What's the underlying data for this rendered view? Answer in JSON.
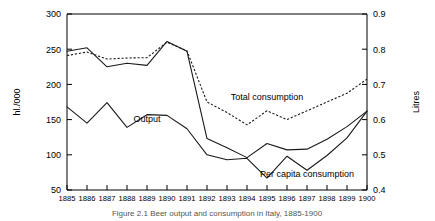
{
  "chart_data": {
    "type": "line",
    "title": "",
    "xlabel": "",
    "ylabel": "hl./000",
    "y2label": "Litres",
    "grid": false,
    "legend_position": "inline-annotations",
    "x": [
      1885,
      1886,
      1887,
      1888,
      1889,
      1890,
      1891,
      1892,
      1893,
      1894,
      1895,
      1896,
      1897,
      1898,
      1899,
      1900
    ],
    "xtick_labels": [
      "1885",
      "1886",
      "1887",
      "1888",
      "1889",
      "1890",
      "1891",
      "1892",
      "1893",
      "1894",
      "1895",
      "1896",
      "1897",
      "1898",
      "1899",
      "1900"
    ],
    "ylim": [
      50,
      300
    ],
    "ytick_labels": [
      "300",
      "250",
      "200",
      "150",
      "100",
      "50"
    ],
    "ytick_values": [
      300,
      250,
      200,
      150,
      100,
      50
    ],
    "y2lim": [
      0.4,
      0.9
    ],
    "y2tick_labels": [
      "0.9",
      "0.8",
      "0.7",
      "0.6",
      "0.5",
      "0.4"
    ],
    "y2tick_values": [
      0.9,
      0.8,
      0.7,
      0.6,
      0.5,
      0.4
    ],
    "series": [
      {
        "name": "Total consumption",
        "axis": "left",
        "style": "solid",
        "label": "Total consumption",
        "values": [
          247,
          252,
          225,
          230,
          227,
          261,
          247,
          123,
          110,
          96,
          116,
          107,
          108,
          122,
          140,
          162
        ]
      },
      {
        "name": "Per capita consumption",
        "axis": "right",
        "style": "dotted",
        "label": "Per capita consumption",
        "values": [
          0.782,
          0.792,
          0.772,
          0.775,
          0.776,
          0.82,
          0.795,
          0.65,
          0.62,
          0.585,
          0.625,
          0.6,
          0.625,
          0.65,
          0.675,
          0.715
        ]
      },
      {
        "name": "Output",
        "axis": "left",
        "style": "solid",
        "label": "Output",
        "values": [
          168,
          145,
          174,
          139,
          157,
          156,
          137,
          100,
          93,
          95,
          67,
          98,
          78,
          99,
          124,
          162
        ]
      }
    ],
    "annotations": [
      {
        "text": "Total consumption",
        "x": 1895,
        "y": 178
      },
      {
        "text": "Output",
        "x": 1889,
        "y": 146
      },
      {
        "text": "Per capita consumption",
        "x": 1897,
        "y": 69
      }
    ]
  },
  "caption": {
    "text": "Figure 2.1 Beer output and consumption in Italy, 1885-1900"
  }
}
